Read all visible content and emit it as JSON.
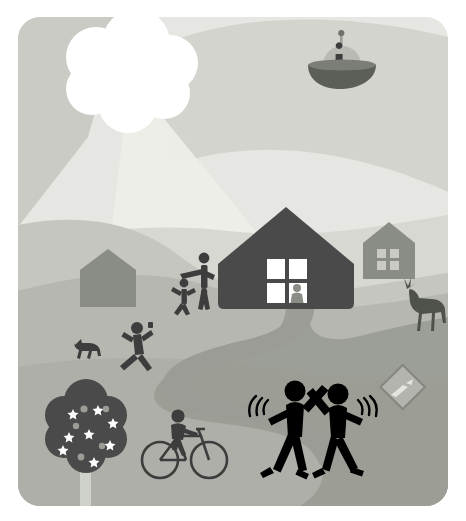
{
  "artwork": {
    "title": "Rural Neighborhood Scene with UFO",
    "medium": "flat vector illustration",
    "canvas": {
      "width": 466,
      "height": 521
    },
    "frame": {
      "x": 18,
      "y": 17,
      "width": 430,
      "height": 489,
      "corner_radius": 22,
      "background": "#ffffff"
    },
    "palette": {
      "page_background": "#ffffff",
      "sky_light": "#e6e6e2",
      "sky_wedge_dark": "#c9cbc4",
      "sky_band_mid": "#d2d4cd",
      "light_ray": "#eeeee9",
      "cloud_white": "#ffffff",
      "hill_far": "#d7d8d2",
      "hill_mid": "#c4c6bf",
      "hill_near": "#b5b7b0",
      "ground_front": "#adafa8",
      "road": "#9a9c95",
      "house_dark": "#4a4a4a",
      "house_mid_gray": "#8a8c86",
      "figure_black": "#000000",
      "figure_dark_gray": "#3d3d3d",
      "window_white": "#ffffff",
      "sign_gray": "#a8aaa3"
    }
  },
  "scene": {
    "sky": {
      "name": "sky",
      "label": "Overcast sky",
      "elements": [
        {
          "id": "sky-base",
          "label": "Sky background",
          "color": "#e6e6e2"
        },
        {
          "id": "sky-wedge-left",
          "label": "Darker sky wedge upper left",
          "color": "#c9cbc4"
        },
        {
          "id": "sky-band-right",
          "label": "Mid-tone sky band upper right",
          "color": "#d2d4cd"
        },
        {
          "id": "light-ray",
          "label": "Light ray cone from cloud",
          "color": "#eeeee9"
        }
      ]
    },
    "cloud": {
      "name": "cloud",
      "label": "Puffy white cloud hiding the sun",
      "color": "#ffffff",
      "position": {
        "cx": 110,
        "cy": 48
      },
      "puff_count": 8
    },
    "ufo": {
      "name": "ufo",
      "label": "Flying saucer with occupant",
      "position": {
        "cx": 324,
        "cy": 56
      },
      "parts": [
        {
          "id": "ufo-antenna",
          "label": "Antenna mast",
          "color": "#9a9c95"
        },
        {
          "id": "ufo-antenna-tip",
          "label": "Antenna ball tip",
          "color": "#6f716b"
        },
        {
          "id": "ufo-dome",
          "label": "Glass dome",
          "color": "#b8bab3"
        },
        {
          "id": "ufo-pilot",
          "label": "Alien pilot silhouette",
          "color": "#3d3d3d"
        },
        {
          "id": "ufo-saucer",
          "label": "Saucer body",
          "color": "#5c5e58"
        }
      ]
    },
    "landscape": {
      "name": "landscape",
      "label": "Rolling hills",
      "layers": [
        {
          "id": "hill-far",
          "label": "Far hill",
          "color": "#d7d8d2"
        },
        {
          "id": "hill-mid",
          "label": "Middle hill",
          "color": "#c4c6bf"
        },
        {
          "id": "hill-near",
          "label": "Near hillside",
          "color": "#b5b7b0"
        },
        {
          "id": "ground-front",
          "label": "Foreground ground",
          "color": "#adafa8"
        }
      ]
    },
    "road": {
      "name": "winding-road",
      "label": "Winding road from house to foreground",
      "color": "#9a9c95"
    },
    "buildings": [
      {
        "id": "main-house",
        "name": "main-house",
        "label": "Main house",
        "color": "#4a4a4a",
        "window": {
          "panes": 4,
          "color": "#ffffff"
        },
        "occupant": {
          "label": "Person seated in window",
          "color": "#8a8c86"
        }
      },
      {
        "id": "right-house",
        "name": "background-house-right",
        "label": "Background house on right",
        "color": "#8a8c86",
        "window": {
          "panes": 4,
          "color": "#c9cbc4"
        }
      },
      {
        "id": "left-barn",
        "name": "background-barn-left",
        "label": "Barn on left hill",
        "color": "#8a8c86",
        "window": {
          "panes": 0
        }
      }
    ],
    "figures": [
      {
        "id": "high-five-left",
        "name": "figure-high-five-left",
        "label": "Person giving a high five (left)",
        "color": "#000000",
        "action": "high-five",
        "has_motion_lines": true
      },
      {
        "id": "high-five-right",
        "name": "figure-high-five-right",
        "label": "Person giving a high five (right)",
        "color": "#000000",
        "action": "high-five",
        "has_motion_lines": true
      },
      {
        "id": "adult-greeting",
        "name": "figure-adult-greeting",
        "label": "Adult reaching toward child",
        "color": "#3d3d3d",
        "action": "reaching"
      },
      {
        "id": "child-running",
        "name": "figure-child-running",
        "label": "Child running toward adult",
        "color": "#3d3d3d",
        "action": "running"
      },
      {
        "id": "jogger",
        "name": "figure-jogger",
        "label": "Jogger running with dog",
        "color": "#3d3d3d",
        "action": "running"
      },
      {
        "id": "cyclist",
        "name": "figure-cyclist",
        "label": "Cyclist riding a bicycle",
        "color": "#3d3d3d",
        "action": "cycling"
      }
    ],
    "animals": [
      {
        "id": "dog",
        "name": "dog",
        "label": "Running dog",
        "color": "#3d3d3d"
      },
      {
        "id": "deer",
        "name": "deer",
        "label": "Deer grazing near road",
        "color": "#4f514b"
      }
    ],
    "tree": {
      "name": "blossom-tree",
      "label": "Blossoming fruit tree",
      "canopy_color": "#4a4a4a",
      "trunk_color": "#cfd1cb",
      "blossom_color": "#ffffff",
      "fruit_color": "#9a9c95",
      "blossom_count": 8,
      "fruit_count": 4
    },
    "sign": {
      "name": "road-sign",
      "label": "Diamond warning road sign (winding road)",
      "shape": "diamond",
      "face_color": "#b2b4ad",
      "border_color": "#84867f",
      "post_color": "#9a9c95",
      "symbol": "curve-arrow"
    },
    "motion_lines": {
      "name": "motion-lines",
      "label": "Motion arcs beside high-fiving figures",
      "color": "#000000",
      "arcs_per_side": 3
    }
  }
}
